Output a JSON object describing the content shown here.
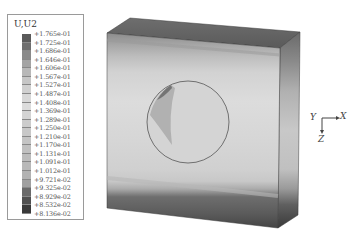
{
  "legend": {
    "title": "U,U2",
    "labels": [
      "+1.765e-01",
      "+1.725e-01",
      "+1.686e-01",
      "+1.646e-01",
      "+1.606e-01",
      "+1.567e-01",
      "+1.527e-01",
      "+1.487e-01",
      "+1.408e-01",
      "+1.369e-01",
      "+1.289e-01",
      "+1.250e-01",
      "+1.210e-01",
      "+1.170e-01",
      "+1.131e-01",
      "+1.091e-01",
      "+1.012e-01",
      "+9.721e-02",
      "+9.325e-02",
      "+8.929e-02",
      "+8.532e-02",
      "+8.136e-02"
    ],
    "band_colors": [
      "#5a5a5a",
      "#6e6e6e",
      "#8a8a8a",
      "#a4a4a4",
      "#b8b8b8",
      "#c6c6c6",
      "#d0d0d0",
      "#d8d8d8",
      "#dcdcdc",
      "#d4d4d4",
      "#cccccc",
      "#c8c8c8",
      "#c4c4c4",
      "#c0c0c0",
      "#bcbcbc",
      "#b8b8b8",
      "#b2b2b2",
      "#a0a0a0",
      "#6a6a6a",
      "#505050",
      "#3a3a3a"
    ]
  },
  "triad": {
    "x_label": "X",
    "y_label": "Y",
    "z_label": "Z"
  }
}
